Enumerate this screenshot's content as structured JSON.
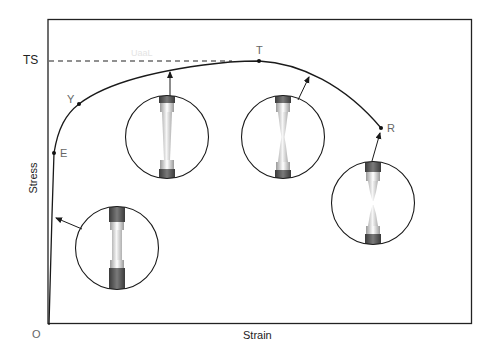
{
  "diagram": {
    "axes": {
      "x_label": "Strain",
      "y_label": "Stress",
      "origin_label": "O",
      "ts_label": "TS"
    },
    "points": [
      {
        "id": "E",
        "label": "E",
        "meaning": "elastic limit"
      },
      {
        "id": "Y",
        "label": "Y",
        "meaning": "yield point"
      },
      {
        "id": "T",
        "label": "T",
        "meaning": "ultimate tensile strength"
      },
      {
        "id": "R",
        "label": "R",
        "meaning": "rupture"
      }
    ],
    "specimens": [
      {
        "id": "uniform-elastic",
        "stage": "elastic deformation"
      },
      {
        "id": "uniform-plastic",
        "stage": "uniform plastic elongation"
      },
      {
        "id": "necking",
        "stage": "necking begins"
      },
      {
        "id": "fracture",
        "stage": "fracture"
      }
    ],
    "ghost_text": "UaaL",
    "colors": {
      "line": "#1a1a1a",
      "grip": "#555555",
      "specimen_body": "#e8e8e8",
      "label_gray": "#666666"
    }
  }
}
